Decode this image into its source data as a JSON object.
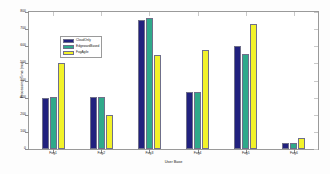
{
  "chart_data": {
    "type": "bar",
    "title": "",
    "xlabel": "User Base",
    "ylabel": "Processing Time (ms)",
    "categories": [
      "Fog1",
      "Fog2",
      "Fog3",
      "Fog4",
      "Fog5",
      "Fog6"
    ],
    "series": [
      {
        "name": "CloudOnly",
        "color": "#21217e",
        "values": [
          300,
          303,
          755,
          335,
          600,
          33
        ]
      },
      {
        "name": "EdgewardBased",
        "color": "#2fa98a",
        "values": [
          305,
          303,
          765,
          335,
          555,
          33
        ]
      },
      {
        "name": "FogAgile",
        "color": "#f2f22a",
        "values": [
          500,
          197,
          550,
          580,
          730,
          62
        ]
      }
    ],
    "ylim": [
      0,
      800
    ],
    "yticks": [
      0,
      100,
      200,
      300,
      400,
      500,
      600,
      700,
      800
    ],
    "ytick_labels": [
      "0",
      "100",
      "200",
      "300",
      "400",
      "500",
      "600",
      "700",
      "800"
    ],
    "grid": false,
    "legend_position": "upper-left",
    "bar_edge_color": "#6f6f8a",
    "axis_color": "#9a9a9a",
    "background": "#ffffff"
  }
}
